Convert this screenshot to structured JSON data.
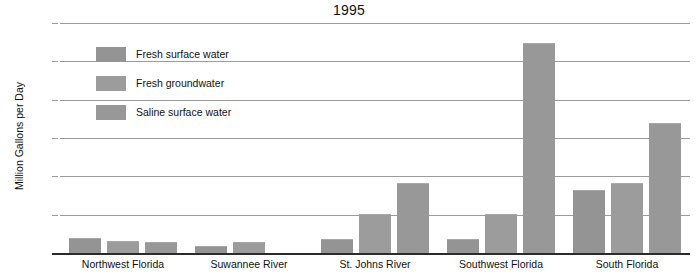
{
  "chart_data": {
    "type": "bar",
    "title": "1995",
    "xlabel": "",
    "ylabel": "Million Gallons per Day",
    "ylim": [
      0,
      6000
    ],
    "ytick_labels": [
      "0",
      "1,000",
      "2,000",
      "3,000",
      "4,000",
      "5,000",
      "6,000"
    ],
    "ytick_values": [
      0,
      1000,
      2000,
      3000,
      4000,
      5000,
      6000
    ],
    "grid": true,
    "legend_position": "upper-left-inside",
    "categories": [
      "Northwest Florida",
      "Suwannee River",
      "St. Johns River",
      "Southwest Florida",
      "South Florida"
    ],
    "series": [
      {
        "name": "Fresh surface water",
        "color": "#949494",
        "values": [
          370,
          150,
          330,
          330,
          1620
        ]
      },
      {
        "name": "Fresh groundwater",
        "color": "#9c9c9c",
        "values": [
          300,
          260,
          990,
          980,
          1800
        ]
      },
      {
        "name": "Saline surface water",
        "color": "#989898",
        "values": [
          270,
          null,
          1790,
          5460,
          3370
        ]
      }
    ]
  }
}
